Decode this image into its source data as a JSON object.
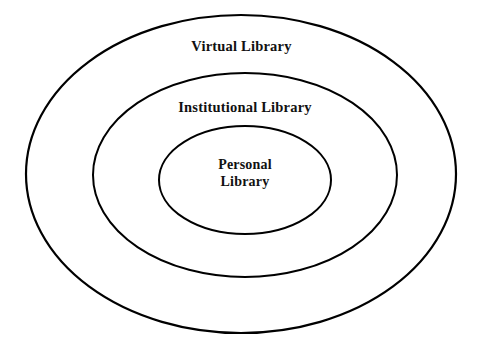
{
  "diagram": {
    "type": "concentric-ellipses",
    "background_color": "#ffffff",
    "stroke_color": "#000000",
    "text_color": "#111111",
    "levels": [
      {
        "id": "virtual",
        "label": "Virtual Library",
        "rank": 1,
        "scope": "outermost",
        "ellipse": {
          "cx": 241,
          "cy": 174,
          "rx": 215,
          "ry": 159,
          "stroke_width": 2.2
        }
      },
      {
        "id": "institutional",
        "label": "Institutional Library",
        "rank": 2,
        "scope": "middle",
        "ellipse": {
          "cx": 245,
          "cy": 175,
          "rx": 152,
          "ry": 102,
          "stroke_width": 2.0
        }
      },
      {
        "id": "personal",
        "label": "Personal Library",
        "label_line_1": "Personal",
        "label_line_2": "Library",
        "rank": 3,
        "scope": "innermost",
        "ellipse": {
          "cx": 245,
          "cy": 180,
          "rx": 86,
          "ry": 54,
          "stroke_width": 2.0
        }
      }
    ]
  }
}
